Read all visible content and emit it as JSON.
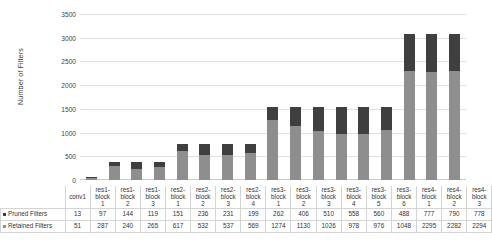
{
  "chart_data": {
    "type": "bar",
    "subtype": "stacked-bar-with-data-table",
    "title": "",
    "xlabel": "",
    "ylabel": "Number of Filters",
    "ylim": [
      0,
      3500
    ],
    "ytick_step": 500,
    "yticks": [
      "0",
      "500",
      "1000",
      "1500",
      "2000",
      "2500",
      "3000",
      "3500"
    ],
    "grid": true,
    "legend_position": "data-table-left",
    "categories": [
      "conv1",
      "res1-block 1",
      "res1-block 2",
      "res1-block 3",
      "res2-block 1",
      "res2-block 2",
      "res2-block 3",
      "res2-block 4",
      "res3-block 1",
      "res3-block 2",
      "res3-block 3",
      "res3-block 4",
      "res3-block 5",
      "res3-block 6",
      "res4-block 1",
      "res4-block 2",
      "res4-block 3"
    ],
    "category_lines": [
      [
        "conv1",
        ""
      ],
      [
        "res1-",
        "block",
        "1"
      ],
      [
        "res1-",
        "block",
        "2"
      ],
      [
        "res1-",
        "block",
        "3"
      ],
      [
        "res2-",
        "block",
        "1"
      ],
      [
        "res2-",
        "block",
        "2"
      ],
      [
        "res2-",
        "block",
        "3"
      ],
      [
        "res2-",
        "block",
        "4"
      ],
      [
        "res3-",
        "block",
        "1"
      ],
      [
        "res3-",
        "block",
        "2"
      ],
      [
        "res3-",
        "block",
        "3"
      ],
      [
        "res3-",
        "block",
        "4"
      ],
      [
        "res3-",
        "block",
        "5"
      ],
      [
        "res3-",
        "block",
        "6"
      ],
      [
        "res4-",
        "block",
        "1"
      ],
      [
        "res4-",
        "block",
        "2"
      ],
      [
        "res4-",
        "block",
        "3"
      ]
    ],
    "series": [
      {
        "name": "Pruned Filters",
        "color": "#3f3f3f",
        "values": [
          13,
          97,
          144,
          119,
          151,
          236,
          231,
          199,
          262,
          406,
          510,
          558,
          560,
          488,
          777,
          790,
          778
        ]
      },
      {
        "name": "Retained Filters",
        "color": "#8e8e8e",
        "values": [
          51,
          287,
          240,
          265,
          617,
          532,
          537,
          569,
          1274,
          1130,
          1026,
          978,
          976,
          1048,
          2295,
          2282,
          2294
        ]
      }
    ]
  },
  "table": {
    "row_labels": [
      "Pruned Filters",
      "Retained Filters"
    ]
  }
}
